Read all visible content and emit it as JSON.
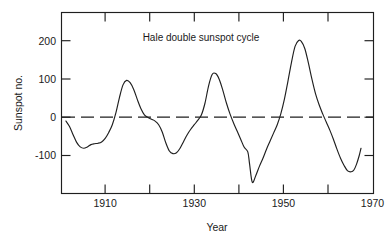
{
  "chart_data": {
    "type": "line",
    "title": "Hale double sunspot cycle",
    "xlabel": "Year",
    "ylabel": "Sunspot no.",
    "xlim": [
      1904,
      1974
    ],
    "ylim": [
      -160,
      240
    ],
    "grid": false,
    "legend": null,
    "x_ticks_major": [
      1910,
      1930,
      1950,
      1970
    ],
    "x_tick_labels": [
      "1910",
      "1930",
      "1950",
      "1970"
    ],
    "x_ticks_minor": [
      1910,
      1920,
      1930,
      1940,
      1950,
      1960,
      1970
    ],
    "y_ticks": [
      200,
      100,
      0,
      -100
    ],
    "y_tick_labels": [
      "200",
      "100",
      "0",
      "-100"
    ],
    "reference_line": {
      "value": 0,
      "style": "dashed"
    },
    "series": [
      {
        "name": "Hale double sunspot cycle",
        "x": [
          1905.0,
          1905.8,
          1906.6,
          1907.4,
          1908.2,
          1909.0,
          1909.8,
          1910.6,
          1911.4,
          1912.2,
          1913.0,
          1913.8,
          1914.6,
          1915.4,
          1916.2,
          1917.0,
          1917.8,
          1918.6,
          1919.4,
          1920.2,
          1921.0,
          1921.8,
          1922.6,
          1923.4,
          1924.2,
          1925.0,
          1925.8,
          1926.6,
          1927.4,
          1928.2,
          1929.0,
          1929.8,
          1930.6,
          1931.4,
          1932.2,
          1933.0,
          1933.8,
          1934.6,
          1935.4,
          1936.2,
          1937.0,
          1937.8,
          1938.6,
          1939.4,
          1940.2,
          1941.0,
          1941.8,
          1942.6,
          1943.4,
          1944.2,
          1945.0,
          1945.8,
          1946.2,
          1946.8,
          1947.6,
          1948.4,
          1949.2,
          1950.0,
          1950.8,
          1951.6,
          1952.4,
          1953.2,
          1954.0,
          1954.8,
          1955.6,
          1956.4,
          1957.2,
          1957.8,
          1958.6,
          1959.4,
          1960.2,
          1961.0,
          1961.8,
          1962.6,
          1963.4,
          1964.2,
          1965.0,
          1965.8,
          1966.6,
          1967.4,
          1968.2,
          1969.0,
          1969.6,
          1970.2,
          1970.8,
          1971.2
        ],
        "y": [
          0,
          -12,
          -30,
          -47,
          -57,
          -60,
          -57,
          -52,
          -50,
          -49,
          -46,
          -38,
          -25,
          -8,
          18,
          52,
          80,
          90,
          85,
          70,
          48,
          28,
          14,
          8,
          4,
          0,
          -8,
          -24,
          -48,
          -66,
          -72,
          -70,
          -60,
          -45,
          -30,
          -18,
          -8,
          2,
          14,
          40,
          78,
          103,
          105,
          92,
          68,
          40,
          16,
          -4,
          -22,
          -40,
          -58,
          -68,
          -95,
          -135,
          -120,
          -100,
          -82,
          -62,
          -44,
          -26,
          -8,
          16,
          48,
          88,
          130,
          165,
          178,
          176,
          160,
          128,
          92,
          60,
          36,
          16,
          -2,
          -20,
          -40,
          -62,
          -82,
          -98,
          -110,
          -112,
          -108,
          -95,
          -76,
          -60
        ]
      }
    ]
  },
  "figure": {
    "title_text": "Hale double sunspot cycle",
    "y_axis_label": "Sunspot no.",
    "x_axis_label": "Year"
  }
}
